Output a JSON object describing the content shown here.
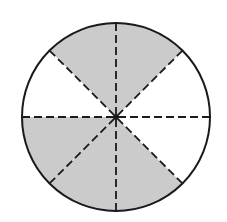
{
  "diagram": {
    "type": "fraction-circle",
    "center": [
      116,
      117
    ],
    "radius": 94,
    "total_sectors": 8,
    "shaded_sectors_count": 5,
    "sectors": [
      {
        "index": 0,
        "start_deg": 0,
        "end_deg": 45,
        "shaded": false
      },
      {
        "index": 1,
        "start_deg": 45,
        "end_deg": 90,
        "shaded": true
      },
      {
        "index": 2,
        "start_deg": 90,
        "end_deg": 135,
        "shaded": true
      },
      {
        "index": 3,
        "start_deg": 135,
        "end_deg": 180,
        "shaded": false
      },
      {
        "index": 4,
        "start_deg": 180,
        "end_deg": 225,
        "shaded": true
      },
      {
        "index": 5,
        "start_deg": 225,
        "end_deg": 270,
        "shaded": true
      },
      {
        "index": 6,
        "start_deg": 270,
        "end_deg": 315,
        "shaded": true
      },
      {
        "index": 7,
        "start_deg": 315,
        "end_deg": 360,
        "shaded": false
      }
    ],
    "colors": {
      "shade": "#cbcbcb",
      "unshaded": "#ffffff",
      "stroke": "#1a1a1a"
    },
    "divider_style": "dashed"
  }
}
